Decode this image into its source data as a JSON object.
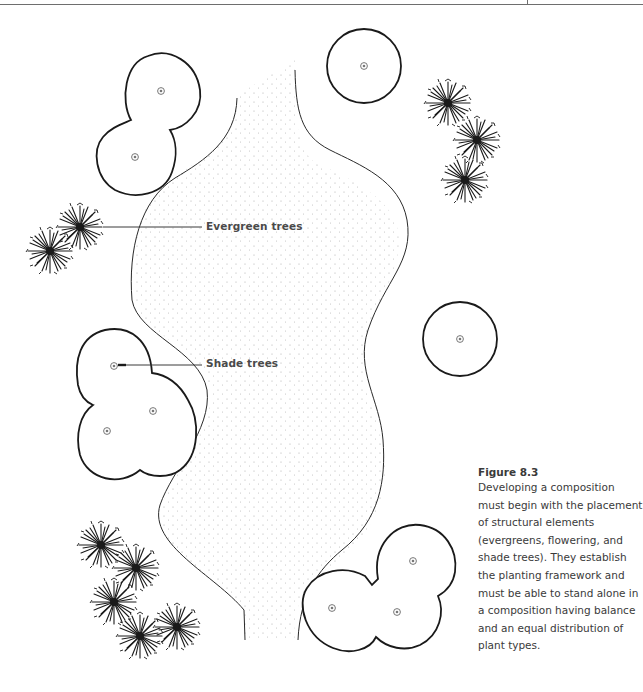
{
  "figure": {
    "title": "Figure 8.3",
    "caption": "Developing a composition must begin with the placement of structural elements (evergreens, flowering, and shade trees). They establish the planting framework and must be able to stand alone in a composition having balance and an equal distribution of plant types."
  },
  "callouts": {
    "evergreen": "Evergreen trees",
    "shade": "Shade trees"
  },
  "plan": {
    "elements": [
      "path-left-edge",
      "path-right-edge",
      "shade-tree-groups",
      "evergreen-groups"
    ],
    "shade_tree_groups": [
      {
        "id": "top-left-pair",
        "count": 2
      },
      {
        "id": "top-middle-single",
        "count": 1
      },
      {
        "id": "mid-left-cluster",
        "count": 3
      },
      {
        "id": "mid-right-single",
        "count": 1
      },
      {
        "id": "bottom-right-cluster",
        "count": 3
      }
    ],
    "evergreen_groups": [
      {
        "id": "top-right",
        "count": 3
      },
      {
        "id": "mid-left",
        "count": 2
      },
      {
        "id": "bottom-left",
        "count": 5
      }
    ],
    "colors": {
      "ink": "#1a1a1a",
      "stipple": "#9a9a9a",
      "label": "#4a4a4a"
    }
  }
}
